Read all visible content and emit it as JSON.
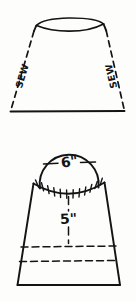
{
  "diagram": {
    "background_color": "#fdfdfc",
    "ink_color": "#141414",
    "figures": [
      {
        "id": "shade-cone",
        "name": "Upper tapered shade panel",
        "labels": [
          {
            "id": "sew-left",
            "text": "SEW",
            "side": "left"
          },
          {
            "id": "sew-right",
            "text": "SEW",
            "side": "right"
          }
        ]
      },
      {
        "id": "gathered-skirt",
        "name": "Lower circle and gathered skirt",
        "labels": [
          {
            "id": "dim-circle",
            "text": "6\"",
            "meaning": "circle diameter"
          },
          {
            "id": "dim-skirt",
            "text": "5\"",
            "meaning": "skirt depth from seam"
          }
        ]
      }
    ],
    "labels": {
      "sew_left": "SEW",
      "sew_right": "SEW",
      "circle_diameter": "6\"",
      "skirt_depth": "5\""
    }
  }
}
